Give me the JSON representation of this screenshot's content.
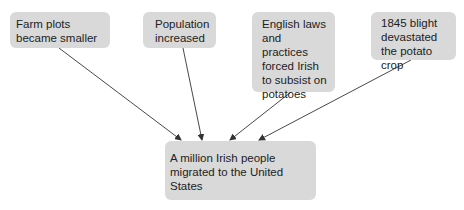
{
  "diagram": {
    "type": "cause-effect",
    "box_color": "#d9d9d9",
    "arrow_color": "#333333",
    "causes": [
      {
        "id": "cause-1",
        "label": "Farm plots became smaller"
      },
      {
        "id": "cause-2",
        "label": "Population increased"
      },
      {
        "id": "cause-3",
        "label": "English laws and practices forced Irish to subsist on potatoes"
      },
      {
        "id": "cause-4",
        "label": "1845 blight devastated the potato crop"
      }
    ],
    "effect": {
      "id": "effect",
      "label": "A million Irish people migrated to the United States"
    },
    "edges": [
      {
        "from": "cause-1",
        "to": "effect"
      },
      {
        "from": "cause-2",
        "to": "effect"
      },
      {
        "from": "cause-3",
        "to": "effect"
      },
      {
        "from": "cause-4",
        "to": "effect"
      }
    ]
  }
}
